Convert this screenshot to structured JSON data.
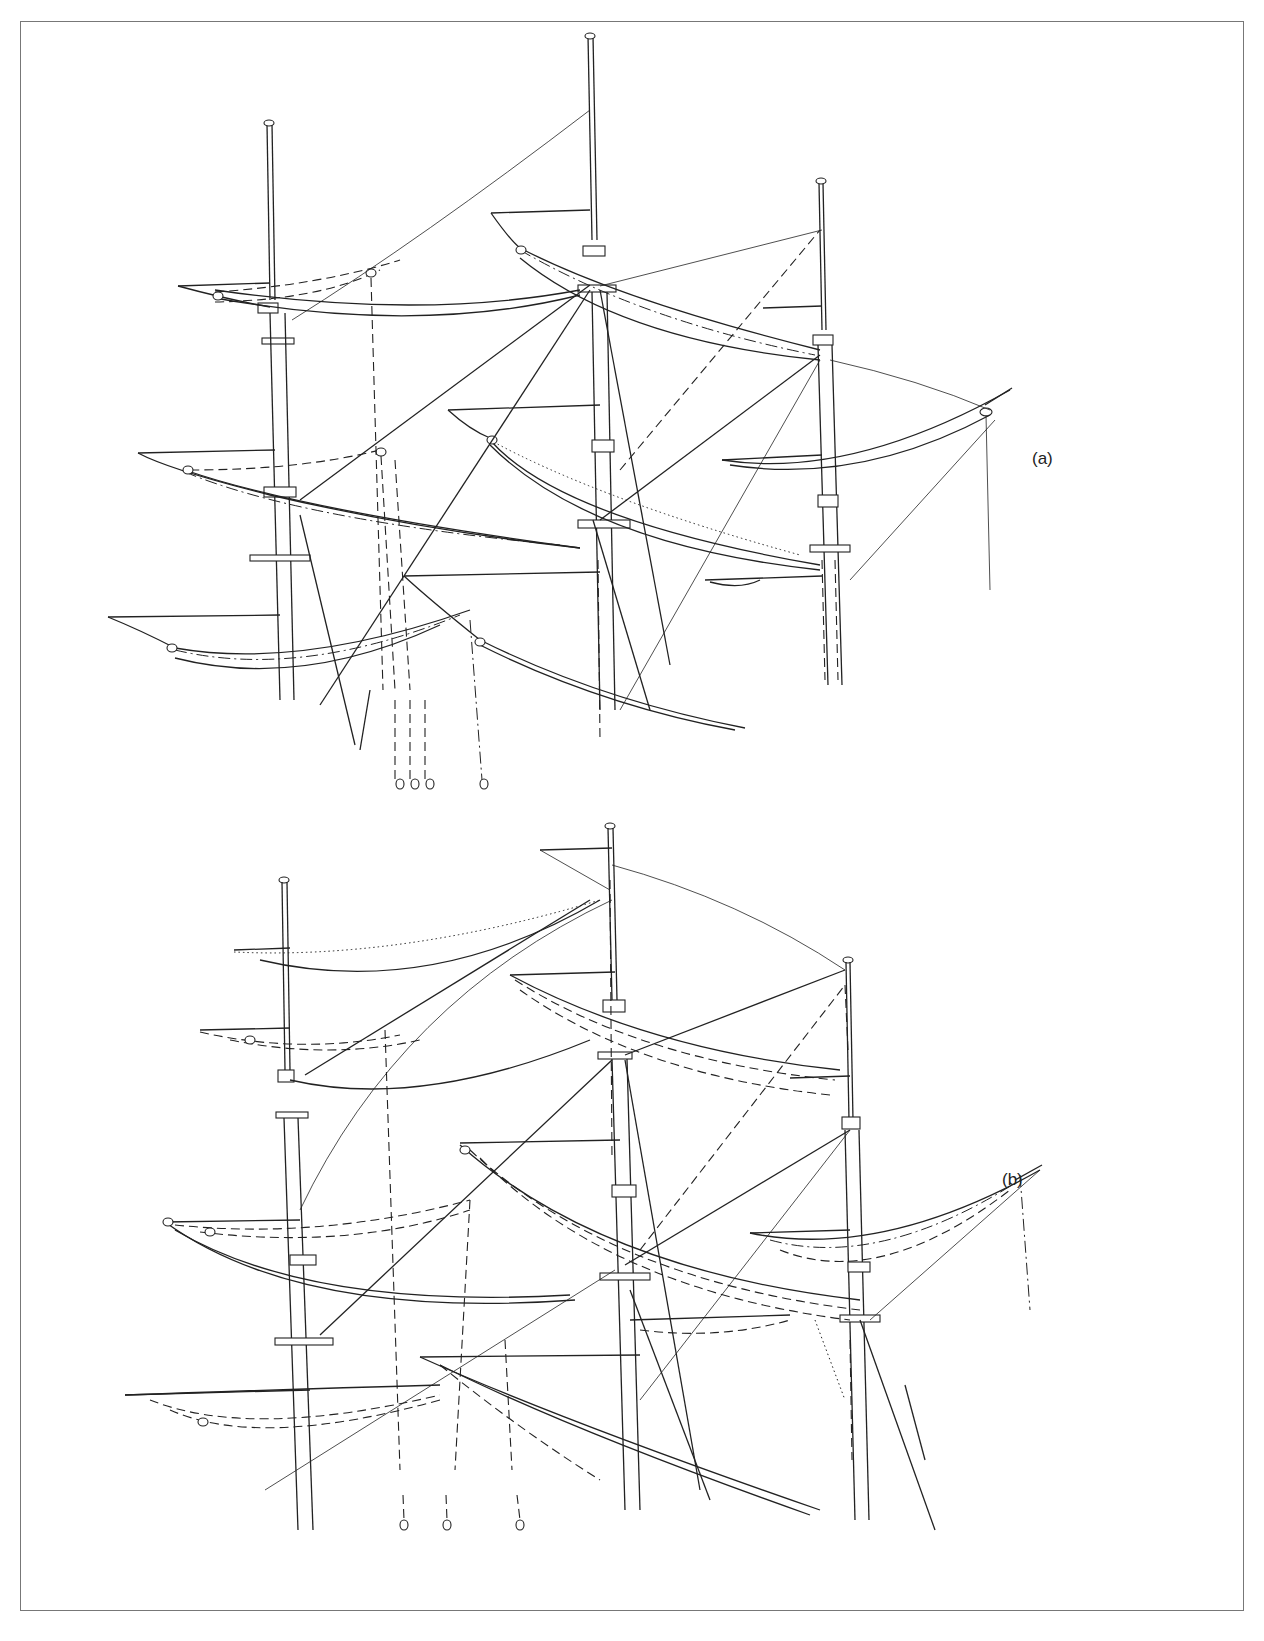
{
  "figure": {
    "panels": [
      {
        "id": "a",
        "label": "(a)"
      },
      {
        "id": "b",
        "label": "(b)"
      }
    ],
    "line_styles": [
      "solid",
      "dashed",
      "dash-dot",
      "dotted"
    ],
    "colors": {
      "ink": "#222222",
      "frame": "#777777",
      "background": "#ffffff"
    }
  }
}
